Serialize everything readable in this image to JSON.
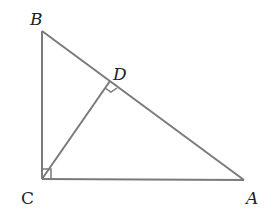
{
  "diagram": {
    "points": {
      "A": {
        "label": "A",
        "x": 244,
        "y": 180
      },
      "B": {
        "label": "B",
        "x": 42,
        "y": 31
      },
      "C": {
        "label": "C",
        "x": 42,
        "y": 179
      },
      "D": {
        "label": "D",
        "x": 110,
        "y": 81
      }
    },
    "segments": [
      "AB",
      "BC",
      "CA",
      "CD"
    ],
    "right_angles": [
      "C (angle BCA)",
      "D (angle CDA)"
    ],
    "colors": {
      "line": "#7a7a7a",
      "text": "#222222"
    }
  }
}
